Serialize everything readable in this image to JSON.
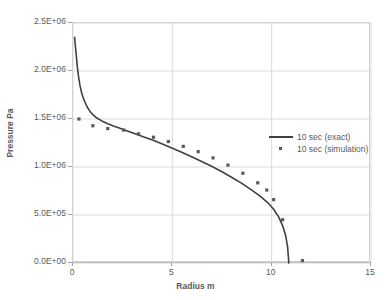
{
  "chart_data": {
    "type": "line",
    "title": "",
    "xlabel": "Radius m",
    "ylabel": "Pressure Pa",
    "xlim": [
      0,
      15
    ],
    "ylim": [
      0,
      2500000
    ],
    "xticks": [
      0,
      5,
      10,
      15
    ],
    "xtick_labels": [
      "0",
      "5",
      "10",
      "15"
    ],
    "yticks": [
      0,
      500000,
      1000000,
      1500000,
      2000000,
      2500000
    ],
    "ytick_labels": [
      "0.0E+00",
      "5.0E+05",
      "1.0E+06",
      "1.5E+06",
      "2.0E+06",
      "2.5E+06"
    ],
    "grid": true,
    "legend_position": "center-right",
    "series": [
      {
        "name": "10 sec (exact)",
        "type": "line",
        "color": "#404040",
        "points": [
          [
            0.08,
            2350000
          ],
          [
            0.12,
            2260000
          ],
          [
            0.17,
            2150000
          ],
          [
            0.22,
            2040000
          ],
          [
            0.28,
            1940000
          ],
          [
            0.35,
            1850000
          ],
          [
            0.45,
            1760000
          ],
          [
            0.55,
            1700000
          ],
          [
            0.7,
            1630000
          ],
          [
            0.85,
            1580000
          ],
          [
            1.0,
            1545000
          ],
          [
            1.2,
            1510000
          ],
          [
            1.45,
            1480000
          ],
          [
            1.7,
            1455000
          ],
          [
            2.0,
            1430000
          ],
          [
            2.4,
            1400000
          ],
          [
            2.8,
            1370000
          ],
          [
            3.2,
            1340000
          ],
          [
            3.6,
            1310000
          ],
          [
            4.0,
            1280000
          ],
          [
            4.5,
            1240000
          ],
          [
            5.0,
            1195000
          ],
          [
            5.5,
            1150000
          ],
          [
            6.0,
            1105000
          ],
          [
            6.5,
            1055000
          ],
          [
            7.0,
            1005000
          ],
          [
            7.5,
            950000
          ],
          [
            8.0,
            890000
          ],
          [
            8.5,
            830000
          ],
          [
            9.0,
            760000
          ],
          [
            9.4,
            700000
          ],
          [
            9.8,
            630000
          ],
          [
            10.1,
            560000
          ],
          [
            10.35,
            480000
          ],
          [
            10.55,
            390000
          ],
          [
            10.7,
            290000
          ],
          [
            10.8,
            170000
          ],
          [
            10.85,
            40000
          ],
          [
            10.86,
            0
          ]
        ]
      },
      {
        "name": "10 sec (simulation)",
        "type": "scatter",
        "color": "#595959",
        "points": [
          [
            0.3,
            1500000
          ],
          [
            1.0,
            1430000
          ],
          [
            1.75,
            1400000
          ],
          [
            2.55,
            1385000
          ],
          [
            3.3,
            1345000
          ],
          [
            4.05,
            1310000
          ],
          [
            4.8,
            1265000
          ],
          [
            5.55,
            1215000
          ],
          [
            6.3,
            1160000
          ],
          [
            7.05,
            1095000
          ],
          [
            7.8,
            1020000
          ],
          [
            8.55,
            935000
          ],
          [
            9.3,
            835000
          ],
          [
            9.75,
            760000
          ],
          [
            10.1,
            660000
          ],
          [
            10.55,
            450000
          ],
          [
            11.55,
            25000
          ]
        ]
      }
    ]
  },
  "legend": {
    "items": [
      {
        "label": "10 sec (exact)",
        "swatch": "line"
      },
      {
        "label": "10 sec (simulation)",
        "swatch": "marker"
      }
    ]
  },
  "axes": {
    "ylabel": "Pressure Pa",
    "xlabel": "Radius m"
  }
}
